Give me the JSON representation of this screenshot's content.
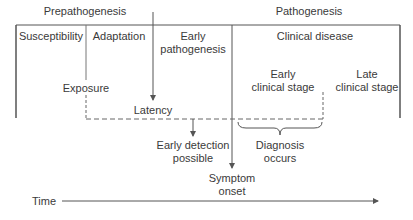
{
  "diagram": {
    "phases": {
      "prepathogenesis": "Prepathogenesis",
      "pathogenesis": "Pathogenesis"
    },
    "stages": {
      "susceptibility": "Susceptibility",
      "adaptation": "Adaptation",
      "early_pathogenesis_line1": "Early",
      "early_pathogenesis_line2": "pathogenesis",
      "clinical_disease": "Clinical disease",
      "early_clinical_line1": "Early",
      "early_clinical_line2": "clinical stage",
      "late_clinical_line1": "Late",
      "late_clinical_line2": "clinical stage"
    },
    "events": {
      "exposure": "Exposure",
      "latency": "Latency",
      "early_detection_line1": "Early detection",
      "early_detection_line2": "possible",
      "diagnosis_line1": "Diagnosis",
      "diagnosis_line2": "occurs",
      "symptom_line1": "Symptom",
      "symptom_line2": "onset"
    },
    "axis": {
      "time_label": "Time"
    },
    "colors": {
      "line": "#555555",
      "text": "#3a3a3a"
    }
  }
}
